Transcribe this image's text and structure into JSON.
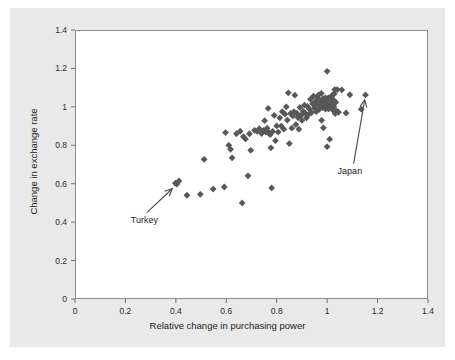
{
  "figure": {
    "background_color": "#e9e9e9",
    "page_background_color": "#ffffff",
    "plot_background_color": "#ffffff",
    "frame_color": "#8d8d8d"
  },
  "chart_data": {
    "type": "scatter",
    "title": "",
    "xlabel": "Relative change in purchasing power",
    "ylabel": "Change in exchange rate",
    "xlim": [
      0,
      1.4
    ],
    "ylim": [
      0,
      1.4
    ],
    "xticks": [
      0,
      0.2,
      0.4,
      0.6,
      0.8,
      1,
      1.2,
      1.4
    ],
    "xtick_labels": [
      "0",
      "0.2",
      "0.4",
      "0.6",
      "0.8",
      "1",
      "1.2",
      "1.4"
    ],
    "yticks": [
      0,
      0.2,
      0.4,
      0.6,
      0.8,
      1,
      1.2,
      1.4
    ],
    "ytick_labels": [
      "0",
      "0.2",
      "0.4",
      "0.6",
      "0.8",
      "1",
      "1.2",
      "1.4"
    ],
    "grid": false,
    "legend": null,
    "marker": {
      "shape": "diamond",
      "color": "#58585a",
      "size_px": 3.4
    },
    "series": [
      {
        "name": "countries",
        "points": [
          [
            0.398,
            0.603
          ],
          [
            0.404,
            0.598
          ],
          [
            0.412,
            0.614
          ],
          [
            0.444,
            0.54
          ],
          [
            0.497,
            0.545
          ],
          [
            0.512,
            0.727
          ],
          [
            0.548,
            0.572
          ],
          [
            0.592,
            0.583
          ],
          [
            0.597,
            0.866
          ],
          [
            0.61,
            0.8
          ],
          [
            0.617,
            0.779
          ],
          [
            0.623,
            0.735
          ],
          [
            0.64,
            0.86
          ],
          [
            0.655,
            0.873
          ],
          [
            0.663,
            0.5
          ],
          [
            0.668,
            0.845
          ],
          [
            0.676,
            0.833
          ],
          [
            0.686,
            0.641
          ],
          [
            0.692,
            0.86
          ],
          [
            0.697,
            0.774
          ],
          [
            0.712,
            0.878
          ],
          [
            0.723,
            0.872
          ],
          [
            0.731,
            0.886
          ],
          [
            0.74,
            0.861
          ],
          [
            0.748,
            0.878
          ],
          [
            0.752,
            0.928
          ],
          [
            0.757,
            0.869
          ],
          [
            0.762,
            0.889
          ],
          [
            0.766,
            0.992
          ],
          [
            0.77,
            0.866
          ],
          [
            0.774,
            0.855
          ],
          [
            0.777,
            0.787
          ],
          [
            0.78,
            0.578
          ],
          [
            0.784,
            0.872
          ],
          [
            0.79,
            0.956
          ],
          [
            0.795,
            0.824
          ],
          [
            0.8,
            0.901
          ],
          [
            0.806,
            0.869
          ],
          [
            0.812,
            0.943
          ],
          [
            0.818,
            0.9
          ],
          [
            0.822,
            0.975
          ],
          [
            0.828,
            0.884
          ],
          [
            0.833,
            0.962
          ],
          [
            0.838,
            1.0
          ],
          [
            0.842,
            0.931
          ],
          [
            0.846,
            1.073
          ],
          [
            0.85,
            0.809
          ],
          [
            0.855,
            0.966
          ],
          [
            0.86,
            0.889
          ],
          [
            0.864,
            0.953
          ],
          [
            0.868,
            0.975
          ],
          [
            0.872,
            1.061
          ],
          [
            0.876,
            0.908
          ],
          [
            0.88,
            0.967
          ],
          [
            0.884,
            0.944
          ],
          [
            0.888,
            0.884
          ],
          [
            0.892,
            0.997
          ],
          [
            0.896,
            0.955
          ],
          [
            0.9,
            0.93
          ],
          [
            0.905,
            0.977
          ],
          [
            0.91,
            1.009
          ],
          [
            0.914,
            0.966
          ],
          [
            0.918,
            0.943
          ],
          [
            0.922,
            1.002
          ],
          [
            0.926,
            0.96
          ],
          [
            0.93,
            0.988
          ],
          [
            0.934,
            1.04
          ],
          [
            0.938,
            0.97
          ],
          [
            0.942,
            1.016
          ],
          [
            0.946,
            1.056
          ],
          [
            0.95,
            0.993
          ],
          [
            0.954,
            1.028
          ],
          [
            0.957,
            0.975
          ],
          [
            0.96,
            1.049
          ],
          [
            0.963,
            1.01
          ],
          [
            0.966,
            1.062
          ],
          [
            0.969,
            0.987
          ],
          [
            0.972,
            1.033
          ],
          [
            0.975,
            1.004
          ],
          [
            0.977,
            1.07
          ],
          [
            0.98,
            1.021
          ],
          [
            0.982,
            0.996
          ],
          [
            0.984,
            1.043
          ],
          [
            0.986,
            1.015
          ],
          [
            0.988,
            1.03
          ],
          [
            0.99,
            1.004
          ],
          [
            0.992,
            1.022
          ],
          [
            0.993,
            1.047
          ],
          [
            0.994,
            0.988
          ],
          [
            0.995,
            1.013
          ],
          [
            0.996,
            1.035
          ],
          [
            0.997,
            1.0
          ],
          [
            0.998,
            1.024
          ],
          [
            0.999,
            1.008
          ],
          [
            1.0,
            1.185
          ],
          [
            1.0,
            1.041
          ],
          [
            1.0,
            0.996
          ],
          [
            1.001,
            1.018
          ],
          [
            1.002,
            1.003
          ],
          [
            1.003,
            1.031
          ],
          [
            1.004,
            1.012
          ],
          [
            1.005,
            1.047
          ],
          [
            1.006,
            0.99
          ],
          [
            1.007,
            1.022
          ],
          [
            1.008,
            1.006
          ],
          [
            1.009,
            1.036
          ],
          [
            1.01,
            1.015
          ],
          [
            1.011,
            0.998
          ],
          [
            1.012,
            1.027
          ],
          [
            1.013,
            1.009
          ],
          [
            1.014,
            1.043
          ],
          [
            1.015,
            1.019
          ],
          [
            1.016,
            0.994
          ],
          [
            1.017,
            1.03
          ],
          [
            1.018,
            1.011
          ],
          [
            1.02,
            1.06
          ],
          [
            1.022,
            0.985
          ],
          [
            1.024,
            1.038
          ],
          [
            1.026,
            1.002
          ],
          [
            1.028,
            1.068
          ],
          [
            1.03,
            1.09
          ],
          [
            1.032,
            0.965
          ],
          [
            1.034,
            1.024
          ],
          [
            1.036,
            0.98
          ],
          [
            1.0,
            0.793
          ],
          [
            1.01,
            0.832
          ],
          [
            0.985,
            0.891
          ],
          [
            0.978,
            0.93
          ],
          [
            1.04,
            1.09
          ],
          [
            1.045,
            0.972
          ],
          [
            1.058,
            1.088
          ],
          [
            1.075,
            0.968
          ],
          [
            1.09,
            1.063
          ],
          [
            1.135,
            0.988
          ],
          [
            1.152,
            1.062
          ]
        ]
      }
    ],
    "annotations": [
      {
        "label": "Turkey",
        "target_x": 0.398,
        "target_y": 0.594,
        "label_x": 0.285,
        "label_y": 0.413,
        "arrow": true
      },
      {
        "label": "Japan",
        "target_x": 1.152,
        "target_y": 1.062,
        "label_x": 1.105,
        "label_y": 0.668,
        "arrow": true
      }
    ]
  }
}
